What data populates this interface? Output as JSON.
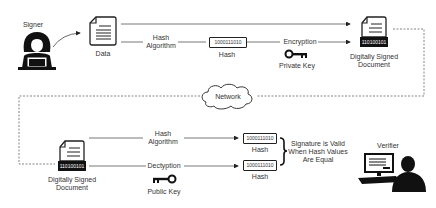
{
  "diagram": {
    "type": "digital-signature-flow",
    "actors": {
      "signer": {
        "label": "Signer"
      },
      "verifier": {
        "label": "Verifier"
      }
    },
    "nodes": {
      "data": {
        "label": "Data"
      },
      "hash_algorithm_top": {
        "line1": "Hash",
        "line2": "Algorithm"
      },
      "hash_top": {
        "value": "1000111010",
        "label": "Hash"
      },
      "encryption": {
        "label": "Encryption"
      },
      "private_key": {
        "label": "Private Key"
      },
      "signed_doc_top": {
        "binary": "110100101",
        "line1": "Digitally Signed",
        "line2": "Document"
      },
      "network": {
        "label": "Network"
      },
      "signed_doc_bottom": {
        "binary": "110100101",
        "line1": "Digitally Signed",
        "line2": "Document"
      },
      "hash_algorithm_bottom": {
        "line1": "Hash",
        "line2": "Algorithm"
      },
      "decryption": {
        "label": "Dectyption"
      },
      "public_key": {
        "label": "Public Key"
      },
      "hash_bottom_1": {
        "value": "1000111010",
        "label": "Hash"
      },
      "hash_bottom_2": {
        "value": "1000111010",
        "label": "Hash"
      },
      "validity_note": {
        "line1": "Signature is Valid",
        "line2": "When Hash Values",
        "line3": "Are Equal"
      }
    },
    "colors": {
      "line": "#555555",
      "icon": "#111111",
      "text": "#333333"
    }
  }
}
